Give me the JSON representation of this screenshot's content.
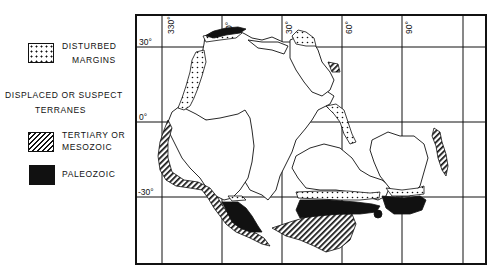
{
  "legend": {
    "disturbed_margins": {
      "line1": "DISTURBED",
      "line2": "MARGINS",
      "pattern": "dotted"
    },
    "section_heading": {
      "line1": "DISPLACED OR SUSPECT",
      "line2": "TERRANES"
    },
    "tertiary_mesozoic": {
      "line1": "TERTIARY OR",
      "line2": "MESOZOIC",
      "pattern": "hatched"
    },
    "paleozoic": {
      "line1": "PALEOZOIC",
      "pattern": "solid-black"
    }
  },
  "map": {
    "longitude_labels": [
      "330°",
      "0°",
      "30°",
      "60°",
      "90°"
    ],
    "latitude_labels": [
      "30°",
      "0°",
      "-30°"
    ],
    "colors": {
      "ink": "#111111",
      "background": "#ffffff"
    }
  }
}
